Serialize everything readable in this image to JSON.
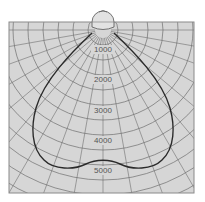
{
  "diagram": {
    "type": "polar-luminous-intensity",
    "colors": {
      "background": "#d6d6d6",
      "frame": "#8a8a8a",
      "grid": "#6e6e6e",
      "curve": "#2a2a2a",
      "label": "#555555"
    },
    "radial_labels": [
      {
        "value": "1000",
        "y": 52
      },
      {
        "value": "2000",
        "y": 82
      },
      {
        "value": "3000",
        "y": 113
      },
      {
        "value": "4000",
        "y": 143
      },
      {
        "value": "5000",
        "y": 173
      }
    ],
    "luminaire_icon": "lamp-dome-icon"
  }
}
